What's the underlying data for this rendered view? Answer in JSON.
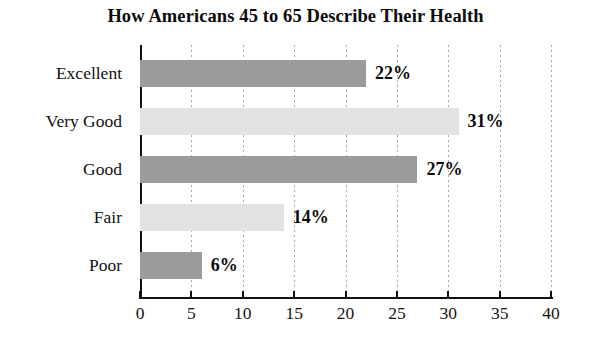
{
  "chart_data": {
    "type": "bar",
    "orientation": "horizontal",
    "title": "How Americans 45 to 65 Describe Their Health",
    "xlabel": "",
    "ylabel": "",
    "categories": [
      "Excellent",
      "Very Good",
      "Good",
      "Fair",
      "Poor"
    ],
    "values": [
      22,
      31,
      27,
      14,
      6
    ],
    "value_labels": [
      "22%",
      "31%",
      "27%",
      "14%",
      "6%"
    ],
    "bar_colors": [
      "#9b9b9b",
      "#e2e2e2",
      "#9b9b9b",
      "#e2e2e2",
      "#9b9b9b"
    ],
    "xlim": [
      0,
      40
    ],
    "xticks": [
      0,
      5,
      10,
      15,
      20,
      25,
      30,
      35,
      40
    ],
    "xtick_labels": [
      "0",
      "5",
      "10",
      "15",
      "20",
      "25",
      "30",
      "35",
      "40"
    ],
    "grid": "vertical-dotted",
    "legend": "none"
  },
  "axis": {
    "x_ticks": [
      {
        "label": "0"
      },
      {
        "label": "5"
      },
      {
        "label": "10"
      },
      {
        "label": "15"
      },
      {
        "label": "20"
      },
      {
        "label": "25"
      },
      {
        "label": "30"
      },
      {
        "label": "35"
      },
      {
        "label": "40"
      }
    ]
  },
  "bars": [
    {
      "label": "Excellent",
      "value_label": "22%"
    },
    {
      "label": "Very Good",
      "value_label": "31%"
    },
    {
      "label": "Good",
      "value_label": "27%"
    },
    {
      "label": "Fair",
      "value_label": "14%"
    },
    {
      "label": "Poor",
      "value_label": "6%"
    }
  ]
}
